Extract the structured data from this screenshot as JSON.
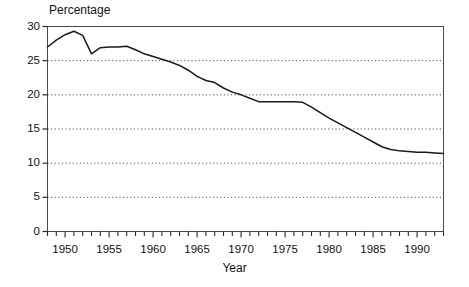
{
  "chart_data": {
    "type": "line",
    "title": "",
    "ylabel": "Percentage",
    "xlabel": "Year",
    "ylim": [
      0,
      30
    ],
    "xlim": [
      1948,
      1993
    ],
    "yticks": [
      0,
      5,
      10,
      15,
      20,
      25,
      30
    ],
    "ytick_labels": [
      "0",
      "5",
      "10",
      "15",
      "20",
      "25",
      "30"
    ],
    "xticks": [
      1950,
      1955,
      1960,
      1965,
      1970,
      1975,
      1980,
      1985,
      1990
    ],
    "xtick_labels": [
      "1950",
      "1955",
      "1960",
      "1965",
      "1970",
      "1975",
      "1980",
      "1985",
      "1990"
    ],
    "minor_xtick_step": 1,
    "grid": "horizontal-dotted",
    "legend": "none",
    "line_color": "#1a1a1a",
    "series": [
      {
        "name": "Percentage",
        "x": [
          1948,
          1949,
          1950,
          1951,
          1952,
          1953,
          1954,
          1955,
          1956,
          1957,
          1958,
          1959,
          1960,
          1961,
          1962,
          1963,
          1964,
          1965,
          1966,
          1967,
          1968,
          1969,
          1970,
          1971,
          1972,
          1973,
          1974,
          1975,
          1976,
          1977,
          1978,
          1979,
          1980,
          1981,
          1982,
          1983,
          1984,
          1985,
          1986,
          1987,
          1988,
          1989,
          1990,
          1991,
          1992,
          1993
        ],
        "values": [
          27.0,
          28.0,
          28.8,
          29.3,
          28.7,
          26.0,
          26.9,
          27.0,
          27.0,
          27.1,
          26.6,
          26.0,
          25.6,
          25.2,
          24.8,
          24.3,
          23.6,
          22.7,
          22.1,
          21.8,
          21.0,
          20.4,
          20.0,
          19.5,
          19.0,
          19.0,
          19.0,
          19.0,
          19.0,
          18.9,
          18.2,
          17.4,
          16.6,
          15.9,
          15.2,
          14.5,
          13.8,
          13.1,
          12.4,
          12.0,
          11.8,
          11.7,
          11.6,
          11.6,
          11.5,
          11.4
        ]
      }
    ]
  }
}
